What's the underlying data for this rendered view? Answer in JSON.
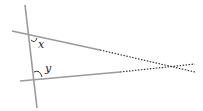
{
  "diagram": {
    "type": "geometry-figure",
    "colors": {
      "line": "#9a9a9a",
      "dotted": "#333333",
      "label": "#222222",
      "background": "#ffffff"
    },
    "labels": {
      "angle_x": "x",
      "angle_y": "y"
    }
  }
}
